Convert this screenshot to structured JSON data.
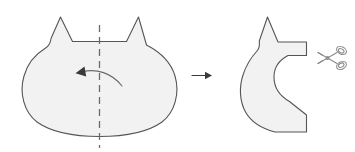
{
  "figure": {
    "title": "Fold and cut instruction diagram",
    "background_color": "#ffffff",
    "shape_fill_color": "#f2f2f2",
    "shape_stroke_color": "#555555",
    "fold_line_color": "#6b6b6b",
    "arrow_color": "#3a3a3a",
    "scissors_color": "#8c8c8c"
  },
  "steps": [
    {
      "id": "step-1",
      "name": "cat-head-unfolded",
      "label": "Cat head shape with vertical fold line",
      "description": "Symmetric cat head silhouette with two pointed ears and a dashed vertical center fold line; a curved arrow shows folding the right half to the left."
    },
    {
      "id": "step-2",
      "name": "cat-head-folded",
      "label": "Folded half shape ready to cut",
      "description": "Half cat head folded in two, forming a C shape with one ear; scissors indicate the cutting line."
    }
  ],
  "annotations": {
    "fold_line_label": "fold line",
    "fold_arrow_label": "fold direction",
    "step_arrow_label": "next step",
    "scissors_label": "cut here"
  },
  "icons": {
    "scissors": "scissors-icon",
    "step_arrow": "arrow-right-icon",
    "fold_arrow": "curved-arrow-left-icon"
  }
}
